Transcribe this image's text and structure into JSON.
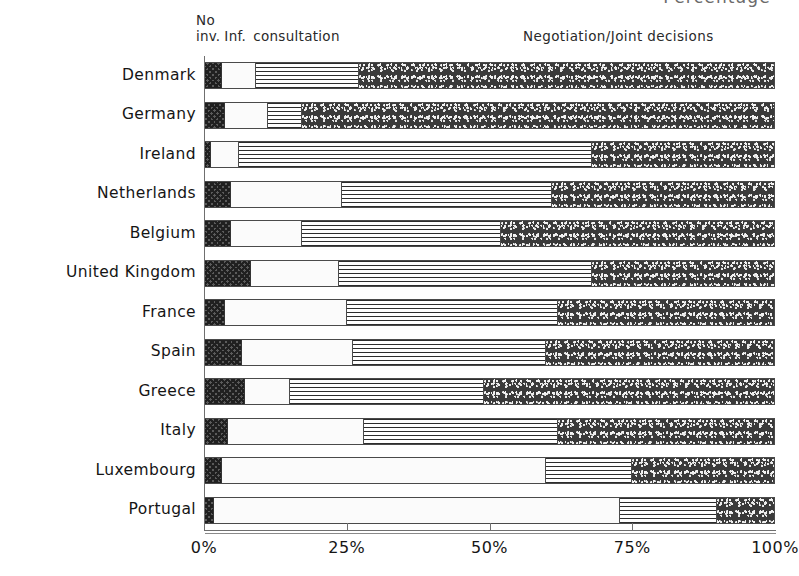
{
  "chart_data": {
    "type": "bar",
    "orientation": "horizontal",
    "stacked": true,
    "normalized": true,
    "title": "Percentage",
    "xlabel": "Percentage",
    "ylabel": "",
    "xlim": [
      0,
      100
    ],
    "xticks": [
      0,
      25,
      50,
      75,
      100
    ],
    "xticklabels": [
      "0%",
      "25%",
      "50%",
      "75%",
      "100%"
    ],
    "grid": false,
    "legend_position": "above-plot",
    "annotations": {
      "left_header_line1": "No",
      "left_header_line2_part1": "inv.",
      "left_header_line2_part2": "Inf.",
      "left_header_line2_part3": "consultation",
      "right_header": "Negotiation/Joint decisions"
    },
    "categories": [
      "Denmark",
      "Germany",
      "Ireland",
      "Netherlands",
      "Belgium",
      "United Kingdom",
      "France",
      "Spain",
      "Greece",
      "Italy",
      "Luxembourg",
      "Portugal"
    ],
    "series": [
      {
        "name": "No inv.",
        "pattern": "checkered",
        "values": [
          3,
          3.5,
          1,
          4.5,
          4.5,
          8,
          3.5,
          6.5,
          7,
          4,
          3,
          1.5
        ]
      },
      {
        "name": "Inf.",
        "pattern": "white",
        "values": [
          6,
          7.5,
          5,
          19.5,
          12.5,
          15.5,
          21.5,
          19.5,
          8,
          24,
          57,
          71.5
        ]
      },
      {
        "name": "consultation",
        "pattern": "horizontal-lines",
        "values": [
          18,
          6,
          62,
          37,
          35,
          44.5,
          37,
          34,
          34,
          34,
          15,
          17
        ]
      },
      {
        "name": "Negotiation/Joint decisions",
        "pattern": "stipple",
        "values": [
          73,
          83,
          32,
          39,
          48,
          32,
          38,
          40,
          51,
          38,
          25,
          10
        ]
      }
    ]
  }
}
